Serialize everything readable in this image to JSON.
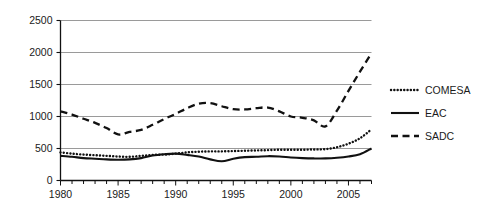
{
  "chart_data": {
    "type": "line",
    "title": "",
    "subtitle": "",
    "xlabel": "",
    "ylabel": "",
    "xlim": [
      1980,
      2007
    ],
    "ylim": [
      0,
      2500
    ],
    "grid": true,
    "legend_position": "right",
    "y_ticks": [
      "0",
      "500",
      "1000",
      "1500",
      "2000",
      "2500"
    ],
    "y_tick_values": [
      0,
      500,
      1000,
      1500,
      2000,
      2500
    ],
    "x_ticks": [
      "1980",
      "1985",
      "1990",
      "1995",
      "2000",
      "2005"
    ],
    "x_tick_values": [
      1980,
      1985,
      1990,
      1995,
      2000,
      2005
    ],
    "x_minor_ticks": [
      1980,
      1981,
      1982,
      1983,
      1984,
      1985,
      1986,
      1987,
      1988,
      1989,
      1990,
      1991,
      1992,
      1993,
      1994,
      1995,
      1996,
      1997,
      1998,
      1999,
      2000,
      2001,
      2002,
      2003,
      2004,
      2005,
      2006,
      2007
    ],
    "x": [
      1980,
      1981,
      1982,
      1983,
      1984,
      1985,
      1986,
      1987,
      1988,
      1989,
      1990,
      1991,
      1992,
      1993,
      1994,
      1995,
      1996,
      1997,
      1998,
      1999,
      2000,
      2001,
      2002,
      2003,
      2004,
      2005,
      2006,
      2007
    ],
    "series": [
      {
        "name": "COMESA",
        "style": "dotted",
        "color": "#111111",
        "values": [
          440,
          420,
          405,
          395,
          385,
          375,
          370,
          385,
          400,
          405,
          420,
          440,
          450,
          455,
          455,
          460,
          465,
          470,
          475,
          480,
          480,
          480,
          485,
          490,
          520,
          575,
          660,
          800
        ]
      },
      {
        "name": "EAC",
        "style": "solid",
        "color": "#111111",
        "values": [
          385,
          370,
          350,
          340,
          330,
          325,
          330,
          350,
          390,
          410,
          420,
          400,
          375,
          330,
          300,
          340,
          365,
          370,
          380,
          375,
          360,
          350,
          345,
          345,
          355,
          375,
          410,
          500
        ]
      },
      {
        "name": "SADC",
        "style": "dashed",
        "color": "#111111",
        "values": [
          1080,
          1030,
          965,
          900,
          820,
          720,
          760,
          790,
          870,
          960,
          1040,
          1130,
          1200,
          1210,
          1160,
          1115,
          1110,
          1130,
          1140,
          1080,
          1000,
          980,
          940,
          845,
          1090,
          1400,
          1700,
          1990
        ]
      }
    ],
    "legend": [
      {
        "label": "COMESA",
        "style": "dotted"
      },
      {
        "label": "EAC",
        "style": "solid"
      },
      {
        "label": "SADC",
        "style": "dashed"
      }
    ]
  }
}
